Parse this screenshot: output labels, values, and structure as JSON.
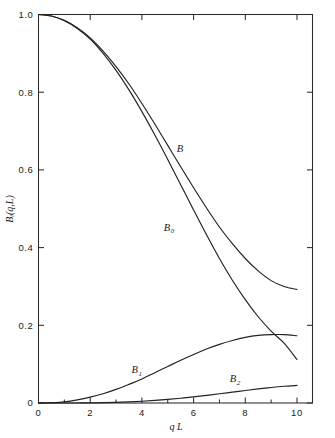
{
  "chart_data": {
    "type": "line",
    "title": "",
    "xlabel": "q L",
    "ylabel": "Bᵢ(q,L)",
    "xlim": [
      0,
      10.6
    ],
    "ylim": [
      0,
      1.0
    ],
    "grid": false,
    "legend_position": "inline-curve-labels",
    "x_ticks": [
      0,
      2,
      4,
      6,
      8,
      10
    ],
    "x_tick_labels": [
      "0",
      "2",
      "4",
      "6",
      "8",
      "10"
    ],
    "x_minor_ticks": [
      1,
      3,
      5,
      7,
      9
    ],
    "y_ticks": [
      0,
      0.2,
      0.4,
      0.6,
      0.8,
      1.0
    ],
    "y_tick_labels": [
      "0",
      "0.2",
      "0.4",
      "0.6",
      "0.8",
      "1.0"
    ],
    "series": [
      {
        "name": "B",
        "label": "B",
        "label_subscript": "",
        "label_x": 5.35,
        "label_y": 0.645,
        "x": [
          0,
          0.5,
          1.0,
          1.5,
          2.0,
          2.5,
          3.0,
          3.5,
          4.0,
          4.5,
          5.0,
          5.5,
          6.0,
          6.5,
          7.0,
          7.5,
          8.0,
          8.5,
          9.0,
          9.5,
          10.0
        ],
        "y": [
          1.0,
          0.996,
          0.985,
          0.966,
          0.94,
          0.906,
          0.866,
          0.821,
          0.771,
          0.718,
          0.663,
          0.608,
          0.554,
          0.502,
          0.453,
          0.41,
          0.372,
          0.34,
          0.315,
          0.3,
          0.292
        ]
      },
      {
        "name": "B0",
        "label": "B",
        "label_subscript": "0",
        "label_x": 4.85,
        "label_y": 0.443,
        "x": [
          0,
          0.5,
          1.0,
          1.5,
          2.0,
          2.5,
          3.0,
          3.5,
          4.0,
          4.5,
          5.0,
          5.5,
          6.0,
          6.5,
          7.0,
          7.5,
          8.0,
          8.5,
          9.0,
          9.5,
          10.0
        ],
        "y": [
          1.0,
          0.996,
          0.984,
          0.964,
          0.937,
          0.9,
          0.856,
          0.806,
          0.75,
          0.69,
          0.627,
          0.562,
          0.497,
          0.433,
          0.372,
          0.316,
          0.266,
          0.222,
          0.185,
          0.154,
          0.112
        ]
      },
      {
        "name": "B1",
        "label": "B",
        "label_subscript": "1",
        "label_x": 3.6,
        "label_y": 0.077,
        "x": [
          0,
          0.5,
          1.0,
          1.5,
          2.0,
          2.5,
          3.0,
          3.5,
          4.0,
          4.5,
          5.0,
          5.5,
          6.0,
          6.5,
          7.0,
          7.5,
          8.0,
          8.5,
          9.0,
          9.5,
          10.0
        ],
        "y": [
          0.0,
          0.0008,
          0.003,
          0.008,
          0.015,
          0.024,
          0.035,
          0.048,
          0.062,
          0.078,
          0.094,
          0.11,
          0.125,
          0.139,
          0.151,
          0.161,
          0.169,
          0.174,
          0.176,
          0.176,
          0.173
        ]
      },
      {
        "name": "B2",
        "label": "B",
        "label_subscript": "2",
        "label_x": 7.4,
        "label_y": 0.054,
        "x": [
          0,
          0.5,
          1.0,
          1.5,
          2.0,
          2.5,
          3.0,
          3.5,
          4.0,
          4.5,
          5.0,
          5.5,
          6.0,
          6.5,
          7.0,
          7.5,
          8.0,
          8.5,
          9.0,
          9.5,
          10.0
        ],
        "y": [
          0.0,
          0.0,
          0.0,
          0.0001,
          0.0003,
          0.0008,
          0.0016,
          0.0028,
          0.0045,
          0.0066,
          0.0092,
          0.0123,
          0.0158,
          0.0196,
          0.0237,
          0.0279,
          0.0321,
          0.0362,
          0.0399,
          0.043,
          0.0452
        ]
      }
    ]
  },
  "colors": {
    "curve": "#222222",
    "axis": "#2b2b2b",
    "text": "#1a1a1a",
    "background": "#ffffff"
  }
}
